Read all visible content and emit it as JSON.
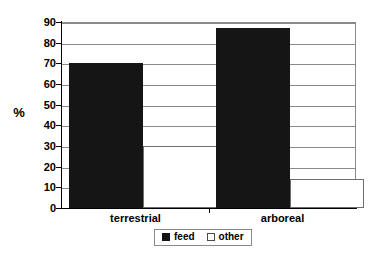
{
  "chart_data": {
    "type": "bar",
    "title": "",
    "xlabel": "",
    "ylabel": "%",
    "ylim": [
      0,
      90
    ],
    "yticks": [
      0,
      10,
      20,
      30,
      40,
      50,
      60,
      70,
      80,
      90
    ],
    "grid": true,
    "legend_position": "bottom-center",
    "categories": [
      "terrestrial",
      "arboreal"
    ],
    "series": [
      {
        "name": "feed",
        "color": "#151515",
        "values": [
          70,
          87
        ]
      },
      {
        "name": "other",
        "color": "#ffffff",
        "values": [
          30,
          14
        ]
      }
    ]
  },
  "legend": {
    "items": [
      {
        "label": "feed",
        "style": "filled"
      },
      {
        "label": "other",
        "style": "outline"
      }
    ]
  },
  "axis": {
    "y_title": "%",
    "tick_labels": [
      "90",
      "80",
      "70",
      "60",
      "50",
      "40",
      "30",
      "20",
      "10",
      "0"
    ]
  },
  "colors": {
    "bar_feed": "#151515",
    "bar_other": "#ffffff",
    "bar_other_border": "#6e6e6e",
    "gridline": "#8a8a8a",
    "axis": "#000000",
    "background": "#ffffff",
    "text": "#000000"
  }
}
